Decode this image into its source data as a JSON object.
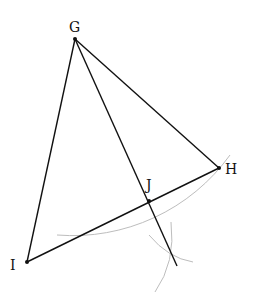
{
  "diagram": {
    "type": "geometric-construction",
    "points": {
      "G": {
        "label": "G",
        "x": 75,
        "y": 39
      },
      "H": {
        "label": "H",
        "x": 219,
        "y": 168
      },
      "I": {
        "label": "I",
        "x": 27,
        "y": 262
      },
      "J": {
        "label": "J",
        "x": 149,
        "y": 201
      }
    },
    "segments": [
      {
        "from": "G",
        "to": "H"
      },
      {
        "from": "G",
        "to": "I"
      },
      {
        "from": "I",
        "to": "H"
      },
      {
        "from": "G",
        "to": "end",
        "end": {
          "x": 177,
          "y": 266
        }
      }
    ],
    "arcs": [
      {
        "name": "arc-centered-G",
        "start": {
          "x": 57,
          "y": 235
        },
        "end": {
          "x": 230,
          "y": 155
        }
      },
      {
        "name": "arc-small-1",
        "start": {
          "x": 149,
          "y": 235
        },
        "end": {
          "x": 193,
          "y": 262
        }
      },
      {
        "name": "arc-small-2",
        "start": {
          "x": 171,
          "y": 222
        },
        "end": {
          "x": 155,
          "y": 292
        }
      }
    ],
    "colors": {
      "line": "#111111",
      "arc": "#bbbbbb",
      "point": "#111111"
    }
  }
}
